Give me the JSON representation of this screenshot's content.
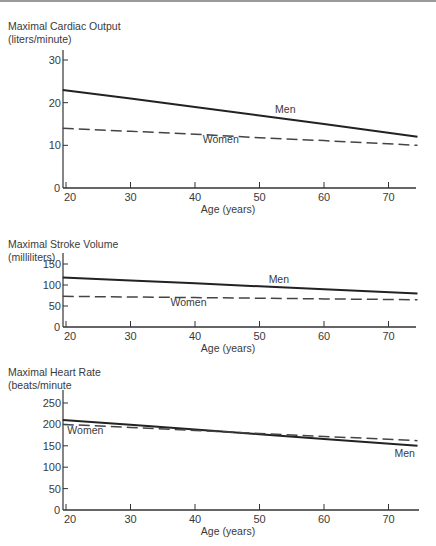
{
  "chart_data": [
    {
      "type": "line",
      "title": "Maximal Cardiac Output",
      "subtitle": "(liters/minute)",
      "xlabel": "Age (years)",
      "ylabel": "Maximal Cardiac Output (liters/minute)",
      "x_ticks": [
        20,
        30,
        40,
        50,
        60,
        70
      ],
      "y_ticks": [
        0,
        10,
        20,
        30
      ],
      "xlim": [
        19.5,
        74.5
      ],
      "ylim": [
        0,
        32
      ],
      "grid": false,
      "legend": "inline labels",
      "series": [
        {
          "name": "Men",
          "style": "solid",
          "x": [
            19.5,
            30,
            40,
            50,
            60,
            74.5
          ],
          "values": [
            23,
            21,
            19,
            17,
            15,
            12
          ]
        },
        {
          "name": "Women",
          "style": "dashed",
          "x": [
            19.5,
            30,
            40,
            50,
            60,
            74.5
          ],
          "values": [
            14,
            13.3,
            12.6,
            11.8,
            11.1,
            10
          ]
        }
      ],
      "labels": [
        {
          "text": "Men",
          "x": 54,
          "y": 17.5
        },
        {
          "text": "Women",
          "x": 44,
          "y": 10.5
        }
      ]
    },
    {
      "type": "line",
      "title": "Maximal Stroke Volume",
      "subtitle": "(milliliters)",
      "xlabel": "Age (years)",
      "ylabel": "Maximal Stroke Volume (milliliters)",
      "x_ticks": [
        20,
        30,
        40,
        50,
        60,
        70
      ],
      "y_ticks": [
        0,
        50,
        100,
        150
      ],
      "xlim": [
        19.5,
        74.5
      ],
      "ylim": [
        0,
        175
      ],
      "grid": false,
      "legend": "inline labels",
      "series": [
        {
          "name": "Men",
          "style": "solid",
          "x": [
            19.5,
            30,
            40,
            50,
            60,
            74.5
          ],
          "values": [
            118,
            111,
            104,
            97,
            90,
            80
          ]
        },
        {
          "name": "Women",
          "style": "dashed",
          "x": [
            19.5,
            30,
            40,
            50,
            60,
            74.5
          ],
          "values": [
            73,
            71.5,
            70,
            68.5,
            67,
            65
          ]
        }
      ],
      "labels": [
        {
          "text": "Men",
          "x": 53,
          "y": 105
        },
        {
          "text": "Women",
          "x": 39,
          "y": 50
        }
      ]
    },
    {
      "type": "line",
      "title": "Maximal Heart Rate",
      "subtitle": "(beats/minute",
      "xlabel": "Age (years)",
      "ylabel": "Maximal Heart Rate (beats/minute)",
      "x_ticks": [
        20,
        30,
        40,
        50,
        60,
        70
      ],
      "y_ticks": [
        0,
        50,
        100,
        150,
        200,
        250
      ],
      "xlim": [
        19.5,
        74.5
      ],
      "ylim": [
        0,
        280
      ],
      "grid": false,
      "legend": "inline labels",
      "series": [
        {
          "name": "Men",
          "style": "solid",
          "x": [
            19.5,
            30,
            40,
            50,
            60,
            74.5
          ],
          "values": [
            210,
            199,
            188,
            177,
            166,
            150
          ]
        },
        {
          "name": "Women",
          "style": "dashed",
          "x": [
            19.5,
            30,
            40,
            50,
            60,
            74.5
          ],
          "values": [
            200,
            193,
            186,
            179,
            172,
            162
          ]
        }
      ],
      "labels": [
        {
          "text": "Women",
          "x": 23,
          "y": 178
        },
        {
          "text": "Men",
          "x": 72.5,
          "y": 125
        }
      ]
    }
  ],
  "charts": [
    {
      "title": "Maximal Cardiac Output",
      "subtitle": "(liters/minute)",
      "xlabel": "Age (years)",
      "labels": {
        "men": "Men",
        "women": "Women"
      },
      "y_tick_labels": [
        "0",
        "10",
        "20",
        "30"
      ],
      "x_tick_labels": [
        "20",
        "30",
        "40",
        "50",
        "60",
        "70"
      ]
    },
    {
      "title": "Maximal Stroke Volume",
      "subtitle": "(milliliters)",
      "xlabel": "Age (years)",
      "labels": {
        "men": "Men",
        "women": "Women"
      },
      "y_tick_labels": [
        "0",
        "50",
        "100",
        "150"
      ],
      "x_tick_labels": [
        "20",
        "30",
        "40",
        "50",
        "60",
        "70"
      ]
    },
    {
      "title": "Maximal Heart Rate",
      "subtitle": "(beats/minute",
      "xlabel": "Age (years)",
      "labels": {
        "men": "Men",
        "women": "Women"
      },
      "y_tick_labels": [
        "0",
        "50",
        "100",
        "150",
        "200",
        "250"
      ],
      "x_tick_labels": [
        "20",
        "30",
        "40",
        "50",
        "60",
        "70"
      ]
    }
  ]
}
